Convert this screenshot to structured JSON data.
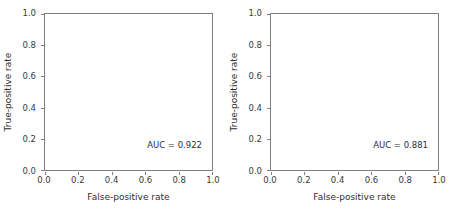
{
  "figure": {
    "width": 452,
    "height": 216,
    "background": "#ffffff",
    "panel_count": 2
  },
  "style": {
    "roc_curve_color": "#4a4a4a",
    "diagonal_color": "#cccccc",
    "frame_color": "#808080",
    "tick_color": "#808080",
    "text_color": "#2e2e2e"
  },
  "chart_data": [
    {
      "type": "line",
      "title": "",
      "panel": "left",
      "xlabel": "False-positive rate",
      "ylabel": "True-positive rate",
      "xlim": [
        0.0,
        1.0
      ],
      "ylim": [
        0.0,
        1.0
      ],
      "grid": false,
      "legend": null,
      "xticks": [
        0.0,
        0.2,
        0.4,
        0.6,
        0.8,
        1.0
      ],
      "yticks": [
        0.0,
        0.2,
        0.4,
        0.6,
        0.8,
        1.0
      ],
      "xticklabels": [
        "0.0",
        "0.2",
        "0.4",
        "0.6",
        "0.8",
        "1.0"
      ],
      "yticklabels": [
        "0.0",
        "0.2",
        "0.4",
        "0.6",
        "0.8",
        "1.0"
      ],
      "annotations": [
        {
          "name": "auc-label",
          "text": "AUC = 0.922",
          "x": 0.72,
          "y": 0.17
        }
      ],
      "auc": 0.922,
      "series": [
        {
          "name": "ROC curve",
          "color": "#4a4a4a",
          "x": [
            0.0,
            0.004,
            0.008,
            0.012,
            0.016,
            0.018,
            0.02,
            0.022,
            0.026,
            0.03,
            0.034,
            0.038,
            0.042,
            0.046,
            0.05,
            0.055,
            0.06,
            0.064,
            0.068,
            0.072,
            0.076,
            0.08,
            0.085,
            0.09,
            0.095,
            0.1,
            0.105,
            0.112,
            0.12,
            0.128,
            0.136,
            0.144,
            0.152,
            0.16,
            0.168,
            0.176,
            0.184,
            0.192,
            0.2,
            0.208,
            0.216,
            0.224,
            0.232,
            0.24,
            0.25,
            0.26,
            0.27,
            0.28,
            0.29,
            0.3,
            0.32,
            0.35,
            0.4,
            0.45,
            0.5,
            0.55,
            0.6,
            0.65,
            0.7,
            0.75,
            0.8,
            0.85,
            0.9,
            0.95,
            1.0
          ],
          "y": [
            0.0,
            0.06,
            0.12,
            0.19,
            0.26,
            0.33,
            0.39,
            0.395,
            0.4,
            0.405,
            0.412,
            0.42,
            0.432,
            0.45,
            0.48,
            0.53,
            0.6,
            0.65,
            0.69,
            0.72,
            0.745,
            0.76,
            0.775,
            0.788,
            0.795,
            0.8,
            0.805,
            0.812,
            0.825,
            0.845,
            0.862,
            0.875,
            0.885,
            0.892,
            0.896,
            0.9,
            0.905,
            0.912,
            0.945,
            0.95,
            0.952,
            0.952,
            0.94,
            0.94,
            0.948,
            0.96,
            0.975,
            0.99,
            0.995,
            0.996,
            0.997,
            0.997,
            0.997,
            0.997,
            0.998,
            0.998,
            0.998,
            0.998,
            0.998,
            0.998,
            0.998,
            0.999,
            0.999,
            0.999,
            1.0
          ]
        },
        {
          "name": "Chance diagonal",
          "color": "#cccccc",
          "x": [
            0.0,
            1.0
          ],
          "y": [
            0.0,
            1.0
          ]
        }
      ]
    },
    {
      "type": "line",
      "title": "",
      "panel": "right",
      "xlabel": "False-positive rate",
      "ylabel": "True-positive rate",
      "xlim": [
        0.0,
        1.0
      ],
      "ylim": [
        0.0,
        1.0
      ],
      "grid": false,
      "legend": null,
      "xticks": [
        0.0,
        0.2,
        0.4,
        0.6,
        0.8,
        1.0
      ],
      "yticks": [
        0.0,
        0.2,
        0.4,
        0.6,
        0.8,
        1.0
      ],
      "xticklabels": [
        "0.0",
        "0.2",
        "0.4",
        "0.6",
        "0.8",
        "1.0"
      ],
      "yticklabels": [
        "0.0",
        "0.2",
        "0.4",
        "0.6",
        "0.8",
        "1.0"
      ],
      "annotations": [
        {
          "name": "auc-label",
          "text": "AUC = 0.881",
          "x": 0.72,
          "y": 0.17
        }
      ],
      "auc": 0.881,
      "series": [
        {
          "name": "ROC curve",
          "color": "#4a4a4a",
          "x": [
            0.0,
            0.005,
            0.01,
            0.015,
            0.02,
            0.026,
            0.032,
            0.038,
            0.044,
            0.05,
            0.056,
            0.062,
            0.068,
            0.074,
            0.08,
            0.086,
            0.092,
            0.098,
            0.104,
            0.108,
            0.112,
            0.116,
            0.12,
            0.126,
            0.132,
            0.14,
            0.15,
            0.16,
            0.17,
            0.18,
            0.19,
            0.2,
            0.215,
            0.23,
            0.245,
            0.26,
            0.275,
            0.29,
            0.305,
            0.32,
            0.34,
            0.36,
            0.38,
            0.4,
            0.42,
            0.44,
            0.46,
            0.48,
            0.5,
            0.52,
            0.55,
            0.58,
            0.62,
            0.66,
            0.7,
            0.75,
            0.8,
            0.85,
            0.9,
            0.95,
            1.0
          ],
          "y": [
            0.0,
            0.06,
            0.13,
            0.2,
            0.255,
            0.29,
            0.305,
            0.32,
            0.345,
            0.38,
            0.43,
            0.48,
            0.53,
            0.58,
            0.63,
            0.68,
            0.73,
            0.775,
            0.795,
            0.77,
            0.772,
            0.8,
            0.805,
            0.81,
            0.815,
            0.818,
            0.825,
            0.845,
            0.848,
            0.85,
            0.858,
            0.866,
            0.872,
            0.88,
            0.888,
            0.898,
            0.905,
            0.908,
            0.908,
            0.906,
            0.906,
            0.908,
            0.912,
            0.92,
            0.93,
            0.942,
            0.952,
            0.96,
            0.966,
            0.97,
            0.974,
            0.977,
            0.98,
            0.983,
            0.985,
            0.988,
            0.99,
            0.992,
            0.994,
            0.997,
            1.0
          ]
        },
        {
          "name": "Chance diagonal",
          "color": "#cccccc",
          "x": [
            0.0,
            1.0
          ],
          "y": [
            0.0,
            1.0
          ]
        }
      ]
    }
  ]
}
